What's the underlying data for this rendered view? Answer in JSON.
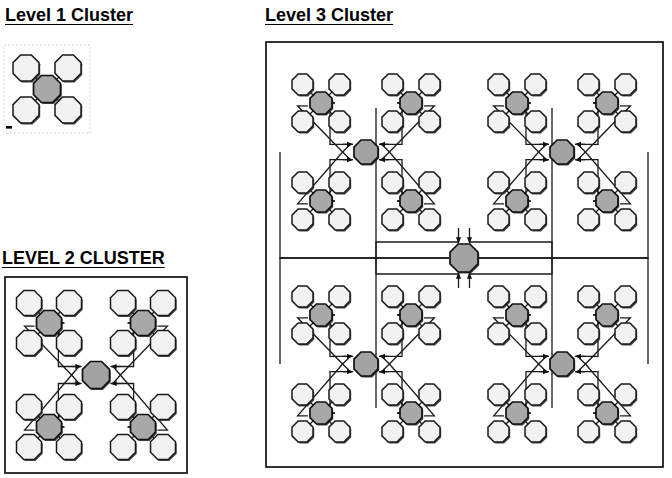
{
  "page": {
    "background": "#ffffff",
    "width": 672,
    "height": 478
  },
  "colors": {
    "hub_fill": "#a8a8a8",
    "leaf_fill": "#f2f2f2",
    "outline": "#1a1a1a",
    "frame": "#000000",
    "link": "#1a1a1a"
  },
  "panels": {
    "level1": {
      "title": "Level 1 Cluster",
      "title_style": "titlecase-underlined",
      "frame": {
        "x": 4,
        "y": 45,
        "w": 86,
        "h": 88,
        "style": "dashed-light"
      },
      "description": "One gray hub node with four white leaf nodes at the corners, joined by straight diagonal spokes.",
      "hub_count": 1,
      "leaf_count": 4,
      "node_shape": "octagon"
    },
    "level2": {
      "title": "LEVEL 2 CLUSTER",
      "title_style": "uppercase-underlined",
      "frame": {
        "x": 5,
        "y": 277,
        "w": 182,
        "h": 196,
        "style": "solid"
      },
      "description": "Four Level 1 clusters arranged in a 2x2 grid around one central gray hub; orthogonal routed links with arrowheads connect the central hub to each of the four sub-hubs.",
      "sub_cluster_count": 4,
      "hub_count": 5,
      "leaf_count": 16,
      "node_shape": "octagon"
    },
    "level3": {
      "title": "Level 3 Cluster",
      "title_style": "titlecase-underlined",
      "frame": {
        "x": 266,
        "y": 42,
        "w": 397,
        "h": 425,
        "style": "solid"
      },
      "description": "Four Level 2 clusters arranged in a 2x2 grid around one central gray hub; orthogonal routed links with arrowheads connect the central hub to each of the four Level 2 hubs.",
      "sub_cluster_count": 4,
      "hub_count": 21,
      "leaf_count": 64,
      "node_shape": "octagon"
    }
  },
  "legend": {
    "hub_label": "hub node (gray)",
    "leaf_label": "leaf node (white)",
    "link_label": "bidirectional routed link"
  }
}
